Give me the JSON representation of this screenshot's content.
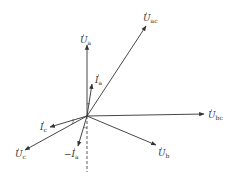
{
  "diagram": {
    "type": "phasor-diagram",
    "origin": [
      87,
      116
    ],
    "phasors": [
      {
        "id": "Ua",
        "base": "U",
        "sub": "a",
        "tip": [
          87,
          45
        ],
        "label_pos": [
          80,
          43
        ]
      },
      {
        "id": "Uac",
        "base": "U",
        "sub": "ac",
        "tip": [
          146,
          26
        ],
        "label_pos": [
          143,
          21
        ]
      },
      {
        "id": "Ia",
        "base": "I",
        "sub": "a",
        "tip": [
          92,
          84
        ],
        "label_pos": [
          95,
          83
        ]
      },
      {
        "id": "Ubc",
        "base": "U",
        "sub": "bc",
        "tip": [
          204,
          114
        ],
        "label_pos": [
          208,
          118
        ]
      },
      {
        "id": "Ub",
        "base": "U",
        "sub": "b",
        "tip": [
          156,
          145
        ],
        "label_pos": [
          158,
          156
        ]
      },
      {
        "id": "Uc",
        "base": "U",
        "sub": "c",
        "tip": [
          25,
          150
        ],
        "label_pos": [
          15,
          157
        ]
      },
      {
        "id": "Ic",
        "base": "I",
        "sub": "c",
        "tip": [
          50,
          127
        ],
        "label_pos": [
          40,
          130
        ]
      },
      {
        "id": "-Ia",
        "base": "I",
        "sub": "a",
        "prefix": "−",
        "tip": [
          78,
          146
        ],
        "label_pos": [
          64,
          157
        ]
      }
    ],
    "dashed_reference": {
      "from": [
        87,
        116
      ],
      "to": [
        87,
        172
      ]
    },
    "angle_marks": [
      "Ua-Ia",
      "Ic-Uc",
      "-Ia-dashed"
    ],
    "line_color": "#333333"
  }
}
